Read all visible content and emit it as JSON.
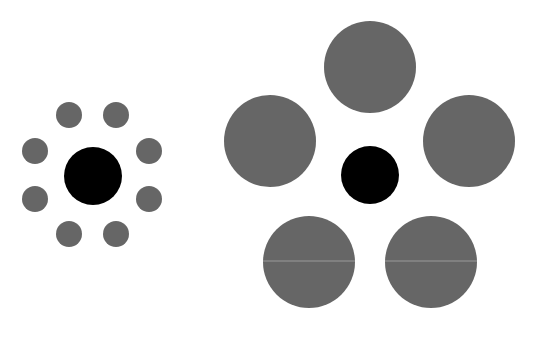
{
  "colors": {
    "background": "#ffffff",
    "target": "#000000",
    "inducer": "#666666",
    "seam": "#9a9a9a"
  },
  "left_figure": {
    "label": "small-inducers",
    "target": {
      "cx": 93,
      "cy": 176,
      "r": 29
    },
    "inducers": [
      {
        "cx": 69,
        "cy": 115,
        "r": 13
      },
      {
        "cx": 116,
        "cy": 115,
        "r": 13
      },
      {
        "cx": 35,
        "cy": 151,
        "r": 13
      },
      {
        "cx": 149,
        "cy": 151,
        "r": 13
      },
      {
        "cx": 35,
        "cy": 199,
        "r": 13
      },
      {
        "cx": 149,
        "cy": 199,
        "r": 13
      },
      {
        "cx": 69,
        "cy": 234,
        "r": 13
      },
      {
        "cx": 116,
        "cy": 234,
        "r": 13
      }
    ]
  },
  "right_figure": {
    "label": "large-inducers",
    "target": {
      "cx": 370,
      "cy": 175,
      "r": 29
    },
    "inducers": [
      {
        "cx": 370,
        "cy": 67,
        "r": 46
      },
      {
        "cx": 270,
        "cy": 141,
        "r": 46
      },
      {
        "cx": 469,
        "cy": 141,
        "r": 46
      },
      {
        "cx": 309,
        "cy": 262,
        "r": 46
      },
      {
        "cx": 431,
        "cy": 262,
        "r": 46
      }
    ]
  }
}
